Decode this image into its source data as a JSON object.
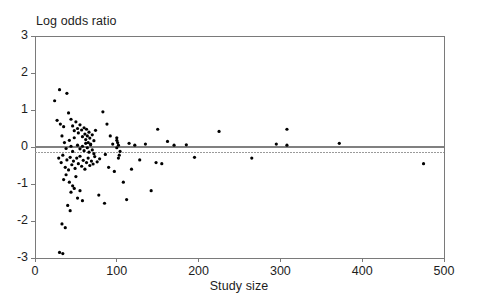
{
  "chart_data": {
    "type": "scatter",
    "title": "",
    "subtitle": "",
    "xlabel": "Study size",
    "ylabel": "Log odds ratio",
    "xlim": [
      0,
      500
    ],
    "ylim": [
      -3,
      3
    ],
    "xticks": [
      0,
      100,
      200,
      300,
      400,
      500
    ],
    "yticks": [
      3,
      2,
      1,
      0,
      -1,
      -2,
      -3
    ],
    "xtick_labels": [
      "0",
      "100",
      "200",
      "300",
      "400",
      "500"
    ],
    "ytick_labels": [
      "3",
      "2",
      "1",
      "0",
      "-1",
      "-2",
      "-3"
    ],
    "grid": false,
    "legend": null,
    "marker": {
      "shape": "circle",
      "color": "#000000",
      "size": 3.2
    },
    "reference_lines": [
      {
        "name": "null-effect-line",
        "orientation": "horizontal",
        "y": 0,
        "style": "solid",
        "color": "#808080",
        "width": 1.6
      },
      {
        "name": "pooled-estimate-line",
        "orientation": "horizontal",
        "y": -0.15,
        "style": "dotted",
        "color": "#9a9a9a",
        "width": 1
      },
      {
        "name": "frame-border",
        "orientation": "box",
        "style": "solid",
        "color": "#7a7a7a",
        "width": 1
      }
    ],
    "series": [
      {
        "name": "studies",
        "points": [
          [
            24,
            1.25
          ],
          [
            30,
            1.55
          ],
          [
            39,
            1.45
          ],
          [
            27,
            0.72
          ],
          [
            31,
            0.62
          ],
          [
            35,
            0.55
          ],
          [
            41,
            0.92
          ],
          [
            44,
            0.75
          ],
          [
            46,
            0.57
          ],
          [
            48,
            0.44
          ],
          [
            50,
            0.68
          ],
          [
            52,
            0.5
          ],
          [
            53,
            0.38
          ],
          [
            55,
            0.6
          ],
          [
            57,
            0.46
          ],
          [
            58,
            0.28
          ],
          [
            60,
            0.52
          ],
          [
            61,
            0.35
          ],
          [
            62,
            0.2
          ],
          [
            63,
            0.48
          ],
          [
            64,
            0.3
          ],
          [
            65,
            0.12
          ],
          [
            66,
            0.4
          ],
          [
            67,
            0.24
          ],
          [
            68,
            0.08
          ],
          [
            70,
            0.33
          ],
          [
            72,
            0.17
          ],
          [
            74,
            0.45
          ],
          [
            52,
            0.05
          ],
          [
            55,
            -0.05
          ],
          [
            58,
            0.02
          ],
          [
            60,
            -0.1
          ],
          [
            62,
            0.1
          ],
          [
            64,
            -0.02
          ],
          [
            66,
            -0.14
          ],
          [
            68,
            0.06
          ],
          [
            70,
            -0.08
          ],
          [
            72,
            -0.18
          ],
          [
            42,
            0.18
          ],
          [
            44,
            0.02
          ],
          [
            46,
            -0.12
          ],
          [
            48,
            0.25
          ],
          [
            33,
            0.3
          ],
          [
            36,
            0.12
          ],
          [
            38,
            -0.04
          ],
          [
            29,
            -0.3
          ],
          [
            32,
            -0.42
          ],
          [
            34,
            -0.22
          ],
          [
            37,
            -0.55
          ],
          [
            39,
            -0.35
          ],
          [
            41,
            -0.62
          ],
          [
            43,
            -0.28
          ],
          [
            45,
            -0.48
          ],
          [
            47,
            -0.38
          ],
          [
            49,
            -0.58
          ],
          [
            51,
            -0.3
          ],
          [
            53,
            -0.45
          ],
          [
            55,
            -0.25
          ],
          [
            57,
            -0.52
          ],
          [
            59,
            -0.36
          ],
          [
            61,
            -0.6
          ],
          [
            63,
            -0.42
          ],
          [
            65,
            -0.3
          ],
          [
            67,
            -0.5
          ],
          [
            69,
            -0.38
          ],
          [
            71,
            -0.46
          ],
          [
            73,
            -0.26
          ],
          [
            76,
            -0.4
          ],
          [
            79,
            -0.32
          ],
          [
            35,
            -0.88
          ],
          [
            38,
            -0.75
          ],
          [
            42,
            -0.95
          ],
          [
            46,
            -1.05
          ],
          [
            50,
            -0.8
          ],
          [
            44,
            -1.22
          ],
          [
            48,
            -1.12
          ],
          [
            52,
            -1.38
          ],
          [
            55,
            -1.18
          ],
          [
            58,
            -1.45
          ],
          [
            40,
            -1.58
          ],
          [
            43,
            -1.72
          ],
          [
            33,
            -2.08
          ],
          [
            37,
            -2.18
          ],
          [
            30,
            -2.85
          ],
          [
            34,
            -2.88
          ],
          [
            83,
            0.95
          ],
          [
            88,
            0.62
          ],
          [
            92,
            0.3
          ],
          [
            95,
            0.08
          ],
          [
            86,
            -0.2
          ],
          [
            90,
            -0.55
          ],
          [
            97,
            -0.66
          ],
          [
            78,
            -1.3
          ],
          [
            85,
            -1.52
          ],
          [
            100,
            0.18
          ],
          [
            102,
            0.05
          ],
          [
            104,
            -0.12
          ],
          [
            100,
            -0.02
          ],
          [
            101,
            0.12
          ],
          [
            103,
            -0.22
          ],
          [
            100,
            0.25
          ],
          [
            102,
            -0.3
          ],
          [
            108,
            -0.95
          ],
          [
            112,
            -1.42
          ],
          [
            118,
            -0.6
          ],
          [
            115,
            0.1
          ],
          [
            122,
            0.05
          ],
          [
            128,
            -0.35
          ],
          [
            135,
            0.08
          ],
          [
            142,
            -1.18
          ],
          [
            148,
            -0.42
          ],
          [
            155,
            -0.45
          ],
          [
            150,
            0.48
          ],
          [
            162,
            0.15
          ],
          [
            170,
            0.05
          ],
          [
            185,
            0.06
          ],
          [
            195,
            -0.28
          ],
          [
            225,
            0.42
          ],
          [
            265,
            -0.3
          ],
          [
            295,
            0.08
          ],
          [
            308,
            0.05
          ],
          [
            308,
            0.48
          ],
          [
            372,
            0.1
          ],
          [
            475,
            -0.45
          ]
        ]
      }
    ]
  },
  "plot_geometry": {
    "frame_left": 35,
    "frame_right": 444,
    "frame_top": 36,
    "frame_bottom": 258
  }
}
